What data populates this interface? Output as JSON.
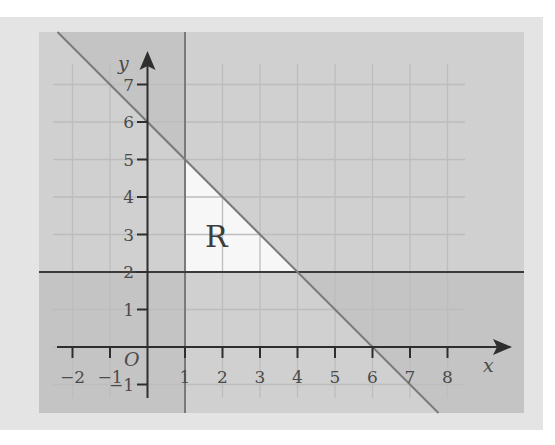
{
  "chart_data": {
    "type": "region-plot",
    "title": "",
    "xlabel": "x",
    "ylabel": "y",
    "origin_label": "O",
    "xlim": [
      -2.9,
      10.0
    ],
    "ylim": [
      -1.75,
      8.4
    ],
    "grid": true,
    "x_ticks": [
      -2,
      -1,
      1,
      2,
      3,
      4,
      5,
      6,
      7,
      8
    ],
    "x_tick_labels": [
      "−2",
      "−1",
      "1",
      "2",
      "3",
      "4",
      "5",
      "6",
      "7",
      "8"
    ],
    "y_ticks": [
      -1,
      1,
      2,
      3,
      4,
      5,
      6,
      7
    ],
    "y_tick_labels": [
      "−1",
      "1",
      "2",
      "3",
      "4",
      "5",
      "6",
      "7"
    ],
    "boundaries": [
      {
        "equation": "x = 1",
        "shaded_side": "x < 1"
      },
      {
        "equation": "y = 2",
        "shaded_side": "y < 2"
      },
      {
        "equation": "x + y = 6",
        "shaded_side": "x + y > 6"
      }
    ],
    "unshaded_region": {
      "label": "R",
      "vertices": [
        [
          1,
          2
        ],
        [
          4,
          2
        ],
        [
          1,
          5
        ]
      ],
      "inequalities": [
        "x >= 1",
        "y >= 2",
        "x + y <= 6"
      ]
    },
    "key_points": {
      "line_x_plus_y_6_intercepts": [
        [
          6,
          0
        ],
        [
          0,
          6
        ]
      ],
      "intersection_y2_diag": [
        4,
        2
      ],
      "intersection_x1_diag": [
        1,
        5
      ]
    },
    "colors": {
      "page_background": "#ffffff",
      "card_background": "#e4e4e4",
      "plot_background": "#ebebeb",
      "region_R": "#f7f7f7",
      "shade": "#b9b9b9",
      "grid": "#bdbdbd",
      "axis": "#2e2e2e",
      "boundary": "#7a7a7a"
    }
  },
  "labels": {
    "x_axis": "x",
    "y_axis": "y",
    "origin": "O",
    "region": "R"
  }
}
